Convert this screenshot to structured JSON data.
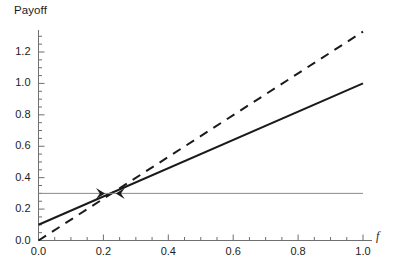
{
  "chart_data": {
    "type": "line",
    "title": "",
    "xlabel": "f",
    "ylabel": "Payoff",
    "xlim": [
      0.0,
      1.0
    ],
    "ylim": [
      0.0,
      1.35
    ],
    "grid": false,
    "legend": null,
    "x_ticks": [
      {
        "value": 0.0,
        "label": "0.0"
      },
      {
        "value": 0.2,
        "label": "0.2"
      },
      {
        "value": 0.4,
        "label": "0.4"
      },
      {
        "value": 0.6,
        "label": "0.6"
      },
      {
        "value": 0.8,
        "label": "0.8"
      },
      {
        "value": 1.0,
        "label": "1.0"
      }
    ],
    "y_ticks": [
      {
        "value": 0.0,
        "label": "0.0"
      },
      {
        "value": 0.2,
        "label": "0.2"
      },
      {
        "value": 0.4,
        "label": "0.4"
      },
      {
        "value": 0.6,
        "label": "0.6"
      },
      {
        "value": 0.8,
        "label": "0.8"
      },
      {
        "value": 1.0,
        "label": "1.0"
      },
      {
        "value": 1.2,
        "label": "1.2"
      }
    ],
    "x_minor_tick_step": 0.05,
    "y_minor_tick_step": 0.05,
    "series": [
      {
        "name": "solid-line",
        "style": "solid",
        "color": "#1a1a1a",
        "width": 2.0,
        "x": [
          0.0,
          1.0
        ],
        "values": [
          0.1,
          1.0
        ]
      },
      {
        "name": "dashed-line",
        "style": "dashed",
        "color": "#1a1a1a",
        "width": 2.0,
        "x": [
          0.0,
          1.0
        ],
        "values": [
          0.0,
          1.33
        ]
      },
      {
        "name": "horizontal-reference-line",
        "style": "solid",
        "color": "#8a8a8a",
        "width": 1.0,
        "x": [
          0.0,
          1.0
        ],
        "values": [
          0.3,
          0.3
        ]
      }
    ],
    "annotations": [
      {
        "name": "arrow-marker-right",
        "type": "arrowhead",
        "direction": "right",
        "x": 0.205,
        "y": 0.3
      },
      {
        "name": "arrow-marker-left",
        "type": "arrowhead",
        "direction": "left",
        "x": 0.238,
        "y": 0.3
      }
    ],
    "intersection_point": {
      "x": 0.222,
      "y": 0.3
    }
  },
  "axes": {
    "y_title": "Payoff",
    "x_title": "f"
  },
  "colors": {
    "ink": "#1a1a1a",
    "axis": "#6f6f6f",
    "reference_line": "#8a8a8a",
    "background": "#ffffff"
  }
}
